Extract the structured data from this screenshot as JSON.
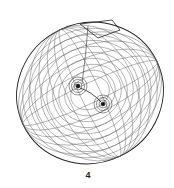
{
  "figure": {
    "label": "4",
    "colors": {
      "line": "#333333",
      "background": "#ffffff"
    }
  }
}
